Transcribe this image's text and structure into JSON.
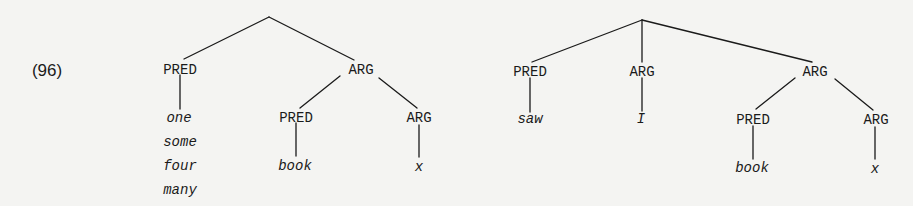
{
  "example": {
    "number": "(96)"
  },
  "tree_left": {
    "pred": {
      "label": "PRED",
      "leaves": [
        "one",
        "some",
        "four",
        "many"
      ]
    },
    "arg": {
      "label": "ARG",
      "pred": {
        "label": "PRED",
        "leaf": "book"
      },
      "arg": {
        "label": "ARG",
        "leaf": "x"
      }
    }
  },
  "tree_right": {
    "pred": {
      "label": "PRED",
      "leaf": "saw"
    },
    "arg1": {
      "label": "ARG",
      "leaf": "I"
    },
    "arg2": {
      "label": "ARG",
      "pred": {
        "label": "PRED",
        "leaf": "book"
      },
      "arg": {
        "label": "ARG",
        "leaf": "x"
      }
    }
  },
  "colors": {
    "ink": "#1a1a1a",
    "background": "#f4f4f2"
  }
}
